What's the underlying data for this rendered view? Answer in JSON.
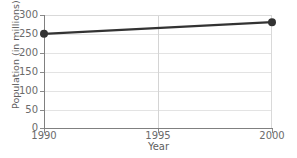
{
  "chart_data": {
    "type": "line",
    "title": "",
    "subtitle": "",
    "xlabel": "Year",
    "ylabel": "Population (in millions)",
    "x": [
      1990,
      2000
    ],
    "values": [
      250,
      281
    ],
    "series": [
      {
        "name": "Population",
        "x": [
          1990,
          2000
        ],
        "values": [
          250,
          281
        ],
        "color": "#333333",
        "marker": "circle"
      }
    ],
    "xlim": [
      1990,
      2000
    ],
    "ylim": [
      0,
      300
    ],
    "xticks": [
      1990,
      1995,
      2000
    ],
    "xtick_labels": [
      "1990",
      "1995",
      "2000"
    ],
    "yticks": [
      0,
      50,
      100,
      150,
      200,
      250,
      300
    ],
    "ytick_labels": [
      "0",
      "50",
      "100",
      "150",
      "200",
      "250",
      "300"
    ],
    "grid": {
      "horizontal": true,
      "vertical": true,
      "color": "#e3e3e3"
    },
    "legend": {
      "visible": false,
      "position": "none"
    },
    "annotations": []
  },
  "colors": {
    "background": "#ffffff",
    "axis": "#808080",
    "grid": "#e3e3e3",
    "grid_vertical": "#d4d4d4",
    "series": "#333333",
    "tick_text": "#6b6b6b",
    "axis_title_text": "#5e5e5e"
  }
}
